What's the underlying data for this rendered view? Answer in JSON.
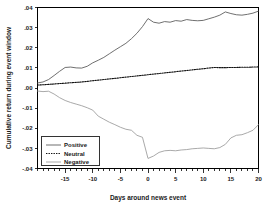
{
  "chart_data": {
    "type": "line",
    "title": "",
    "xlabel": "Days around news event",
    "ylabel": "Cumulative return during event window",
    "xlim": [
      -20,
      20
    ],
    "ylim": [
      -0.04,
      0.04
    ],
    "grid": false,
    "legend_position": "lower-left",
    "xticks": [
      -15,
      -10,
      -5,
      0,
      5,
      10,
      15,
      20
    ],
    "xtick_labels": [
      "-15",
      "-10",
      "-5",
      "0",
      "5",
      "10",
      "15",
      "20"
    ],
    "yticks": [
      0.04,
      0.03,
      0.02,
      0.01,
      0.0,
      -0.01,
      -0.02,
      -0.03,
      -0.04
    ],
    "ytick_labels": [
      ".04",
      ".03",
      ".02",
      ".01",
      ".00",
      "-.01",
      "-.02",
      "-.03",
      "-.04"
    ],
    "x": [
      -20,
      -19,
      -18,
      -17,
      -16,
      -15,
      -14,
      -13,
      -12,
      -11,
      -10,
      -9,
      -8,
      -7,
      -6,
      -5,
      -4,
      -3,
      -2,
      -1,
      0,
      1,
      2,
      3,
      4,
      5,
      6,
      7,
      8,
      9,
      10,
      11,
      12,
      13,
      14,
      15,
      16,
      17,
      18,
      19,
      20
    ],
    "series": [
      {
        "name": "Positive",
        "style": "solid",
        "color": "#555555",
        "values": [
          0.0025,
          0.003,
          0.0042,
          0.0062,
          0.0083,
          0.0102,
          0.0104,
          0.01,
          0.0099,
          0.0108,
          0.0125,
          0.0138,
          0.0152,
          0.017,
          0.0188,
          0.0205,
          0.0222,
          0.0245,
          0.0272,
          0.0305,
          0.0345,
          0.0327,
          0.0322,
          0.033,
          0.0327,
          0.0335,
          0.0332,
          0.034,
          0.0336,
          0.0334,
          0.0336,
          0.0344,
          0.0352,
          0.0362,
          0.0378,
          0.037,
          0.0364,
          0.0362,
          0.0366,
          0.0372,
          0.0382
        ]
      },
      {
        "name": "Neutral",
        "style": "dashed",
        "color": "#111111",
        "values": [
          0.0015,
          0.0016,
          0.0018,
          0.002,
          0.0022,
          0.0024,
          0.0026,
          0.0028,
          0.003,
          0.0033,
          0.0036,
          0.0039,
          0.0042,
          0.0045,
          0.0048,
          0.0051,
          0.0054,
          0.0057,
          0.006,
          0.0063,
          0.0066,
          0.0069,
          0.0072,
          0.0075,
          0.0078,
          0.0081,
          0.0084,
          0.0087,
          0.009,
          0.0093,
          0.0096,
          0.0099,
          0.0102,
          0.0101,
          0.0101,
          0.0102,
          0.0102,
          0.0103,
          0.0103,
          0.0104,
          0.0105
        ]
      },
      {
        "name": "Negative",
        "style": "solid",
        "color": "#9a9a9a",
        "values": [
          -0.0015,
          -0.0018,
          -0.0016,
          -0.003,
          -0.0048,
          -0.0062,
          -0.0072,
          -0.008,
          -0.0088,
          -0.0098,
          -0.011,
          -0.014,
          -0.0155,
          -0.017,
          -0.0182,
          -0.0195,
          -0.0205,
          -0.021,
          -0.0235,
          -0.0245,
          -0.035,
          -0.0338,
          -0.032,
          -0.0312,
          -0.031,
          -0.0312,
          -0.0308,
          -0.0306,
          -0.0302,
          -0.03,
          -0.0298,
          -0.03,
          -0.0302,
          -0.0296,
          -0.028,
          -0.0248,
          -0.0235,
          -0.0232,
          -0.0222,
          -0.021,
          -0.0182
        ]
      }
    ],
    "legend": [
      "Positive",
      "Neutral",
      "Negative"
    ]
  }
}
